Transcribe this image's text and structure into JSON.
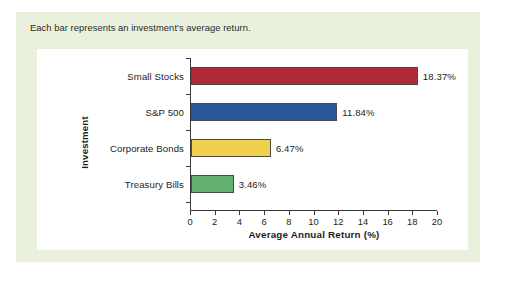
{
  "caption": "Each bar represents an investment's average return.",
  "colors": {
    "panel_background": "#e9f0db",
    "card_background": "#ffffff",
    "page_background": "#ffffff",
    "axis": "#3a3a3a",
    "text": "#1d1d1d"
  },
  "chart_data": {
    "type": "bar",
    "orientation": "horizontal",
    "title": "",
    "subtitle": "",
    "xlabel": "Average Annual Return (%)",
    "ylabel": "Investment",
    "categories": [
      "Small Stocks",
      "S&P 500",
      "Corporate Bonds",
      "Treasury Bills"
    ],
    "values": [
      18.37,
      11.84,
      6.47,
      3.46
    ],
    "value_labels": [
      "18.37%",
      "11.84%",
      "6.47%",
      "3.46%"
    ],
    "bar_colors": [
      "#b02a3a",
      "#2a5699",
      "#efcf4b",
      "#61b06e"
    ],
    "xlim": [
      0,
      20
    ],
    "xticks": [
      0,
      2,
      4,
      6,
      8,
      10,
      12,
      14,
      16,
      18,
      20
    ],
    "xtick_labels": [
      "0",
      "2",
      "4",
      "6",
      "8",
      "10",
      "12",
      "14",
      "16",
      "18",
      "20"
    ],
    "grid": false,
    "legend": false,
    "legend_position": "none"
  }
}
